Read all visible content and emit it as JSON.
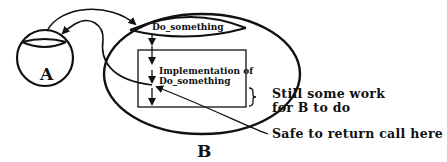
{
  "diagram": {
    "nodes": {
      "a": {
        "label": "A"
      },
      "b": {
        "label": "B"
      }
    },
    "function_name": "Do_something",
    "implementation": {
      "line1": "Implementation of",
      "line2": "Do_something"
    },
    "annotations": {
      "remaining_line1": "Still some work",
      "remaining_line2": "for B to do",
      "safe_return": "Safe to return call here"
    },
    "colors": {
      "stroke": "#111111",
      "background": "#ffffff"
    }
  }
}
